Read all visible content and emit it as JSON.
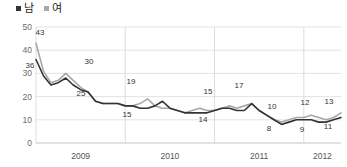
{
  "legend": {
    "position": "top-left",
    "items": [
      {
        "label": "남",
        "color": "#333333",
        "marker": "square"
      },
      {
        "label": "여",
        "color": "#a8a8a8",
        "marker": "square"
      }
    ]
  },
  "chart_data": {
    "type": "line",
    "title": "",
    "subtitle": "",
    "xlabel": "",
    "ylabel": "",
    "ylim": [
      0,
      50
    ],
    "yticks": [
      0,
      10,
      20,
      30,
      40,
      50
    ],
    "ytick_labels": [
      "0",
      "10",
      "20",
      "30",
      "40",
      "50"
    ],
    "grid": true,
    "grid_axis": "both",
    "xtick_labels": [
      "2009",
      "2010",
      "2011",
      "2012"
    ],
    "x": [
      "2009-01",
      "2009-02",
      "2009-03",
      "2009-04",
      "2009-05",
      "2009-06",
      "2009-07",
      "2009-08",
      "2009-09",
      "2009-10",
      "2009-11",
      "2009-12",
      "2010-01",
      "2010-02",
      "2010-03",
      "2010-04",
      "2010-05",
      "2010-06",
      "2010-07",
      "2010-08",
      "2010-09",
      "2010-10",
      "2010-11",
      "2010-12",
      "2011-01",
      "2011-02",
      "2011-03",
      "2011-04",
      "2011-05",
      "2011-06",
      "2011-07",
      "2011-08",
      "2011-09",
      "2011-10",
      "2011-11",
      "2011-12",
      "2012-01",
      "2012-02",
      "2012-03",
      "2012-04",
      "2012-05",
      "2012-06"
    ],
    "series": [
      {
        "name": "남",
        "color": "#333333",
        "values": [
          36,
          29,
          25,
          26,
          28,
          25,
          23,
          22,
          18,
          17,
          17,
          17,
          16,
          16,
          15,
          15,
          16,
          18,
          15,
          14,
          13,
          13,
          13,
          13,
          14,
          15,
          15,
          14,
          14,
          17,
          14,
          12,
          10,
          8,
          9,
          10,
          10,
          10,
          9,
          9,
          10,
          11
        ]
      },
      {
        "name": "여",
        "color": "#a8a8a8",
        "values": [
          43,
          31,
          26,
          27,
          30,
          27,
          24,
          22,
          18,
          17,
          17,
          17,
          16,
          16,
          17,
          19,
          16,
          15,
          15,
          14,
          13,
          14,
          15,
          14,
          14,
          15,
          16,
          15,
          16,
          17,
          14,
          12,
          10,
          9,
          10,
          11,
          11,
          12,
          11,
          10,
          11,
          13
        ]
      }
    ],
    "point_labels": [
      {
        "text": "43",
        "x_px": 40,
        "y_px": 35,
        "series": "여"
      },
      {
        "text": "36",
        "x_px": 30,
        "y_px": 68,
        "series": "남"
      },
      {
        "text": "30",
        "x_px": 89,
        "y_px": 64,
        "series": "여"
      },
      {
        "text": "25",
        "x_px": 81,
        "y_px": 96,
        "series": "남"
      },
      {
        "text": "19",
        "x_px": 131,
        "y_px": 84,
        "series": "여"
      },
      {
        "text": "15",
        "x_px": 127,
        "y_px": 117,
        "series": "남"
      },
      {
        "text": "15",
        "x_px": 208,
        "y_px": 94,
        "series": "여"
      },
      {
        "text": "14",
        "x_px": 203,
        "y_px": 122,
        "series": "남"
      },
      {
        "text": "17",
        "x_px": 239,
        "y_px": 88,
        "series": "여"
      },
      {
        "text": "10",
        "x_px": 272,
        "y_px": 109,
        "series": "여"
      },
      {
        "text": "8",
        "x_px": 269,
        "y_px": 131,
        "series": "남"
      },
      {
        "text": "12",
        "x_px": 305,
        "y_px": 105,
        "series": "여"
      },
      {
        "text": "9",
        "x_px": 302,
        "y_px": 132,
        "series": "남"
      },
      {
        "text": "13",
        "x_px": 329,
        "y_px": 104,
        "series": "여"
      },
      {
        "text": "11",
        "x_px": 328,
        "y_px": 129,
        "series": "남"
      }
    ]
  }
}
